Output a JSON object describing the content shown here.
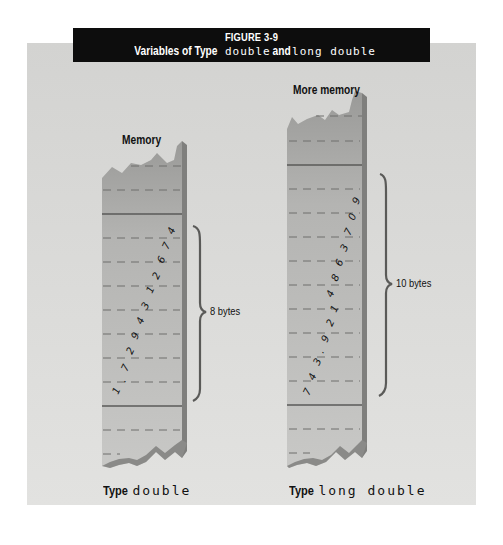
{
  "figure": {
    "number": "FIGURE 3-9",
    "title_prefix": "Variables of Type ",
    "title_type1": "double",
    "title_and": " and ",
    "title_type2": "long double"
  },
  "left_column": {
    "header": "Memory",
    "value_digits": [
      "1",
      ".",
      "7",
      "2",
      "9",
      "4",
      "3",
      "1",
      "2",
      "6",
      "7",
      "4"
    ],
    "size_label": "8 bytes",
    "caption_prefix": "Type ",
    "caption_type": "double"
  },
  "right_column": {
    "header": "More memory",
    "value_digits": [
      "7",
      "4",
      "3",
      ".",
      "9",
      "2",
      "1",
      "4",
      "8",
      "6",
      "3",
      "7",
      "0",
      "9"
    ],
    "size_label": "10 bytes",
    "caption_prefix": "Type ",
    "caption_type": "long double"
  },
  "colors": {
    "background_panel": "#d8d8d6",
    "title_bar": "#0d0d0d",
    "column_fill_top": "#9e9e9c",
    "column_fill": "#bdbdbb",
    "column_side": "#7d7d7b",
    "brace": "#5a5a58"
  }
}
